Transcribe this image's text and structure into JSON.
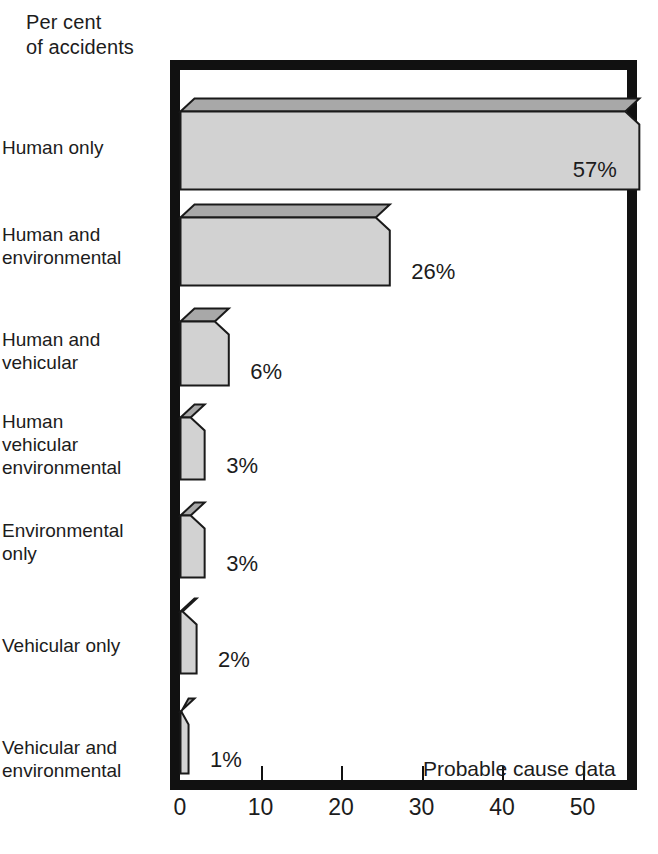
{
  "axis_caption": "Per cent\nof accidents",
  "annotation": "Probable cause data",
  "chart_data": {
    "type": "bar",
    "orientation": "horizontal",
    "title": "",
    "subtitle": "",
    "xlabel": "",
    "ylabel": "Per cent of accidents",
    "annotation": "Probable cause data",
    "xlim": [
      0,
      54
    ],
    "xticks": [
      0,
      10,
      20,
      30,
      40,
      50
    ],
    "xtick_labels": [
      "0",
      "10",
      "20",
      "30",
      "40",
      "50"
    ],
    "grid": false,
    "legend": false,
    "style": "3d-shaded-bars",
    "categories": [
      "Human only",
      "Human and\nenvironmental",
      "Human and\nvehicular",
      "Human\nvehicular\nenvironmental",
      "Environmental\nonly",
      "Vehicular only",
      "Vehicular and\nenvironmental"
    ],
    "values": [
      57,
      26,
      6,
      3,
      3,
      2,
      1
    ],
    "value_labels": [
      "57%",
      "26%",
      "6%",
      "3%",
      "3%",
      "2%",
      "1%"
    ]
  },
  "bars": [
    {
      "label": "Human only",
      "value": 57,
      "value_label": "57%",
      "label_position": "inside",
      "top": 28,
      "height": 78,
      "cat_label_top": 136
    },
    {
      "label": "Human and\nenvironmental",
      "value": 26,
      "value_label": "26%",
      "label_position": "outside",
      "top": 134,
      "height": 68,
      "cat_label_top": 223
    },
    {
      "label": "Human and\nvehicular",
      "value": 6,
      "value_label": "6%",
      "label_position": "outside",
      "top": 238,
      "height": 64,
      "cat_label_top": 328
    },
    {
      "label": "Human\nvehicular\nenvironmental",
      "value": 3,
      "value_label": "3%",
      "label_position": "outside",
      "top": 334,
      "height": 62,
      "cat_label_top": 410
    },
    {
      "label": "Environmental\nonly",
      "value": 3,
      "value_label": "3%",
      "label_position": "outside",
      "top": 432,
      "height": 62,
      "cat_label_top": 519
    },
    {
      "label": "Vehicular only",
      "value": 2,
      "value_label": "2%",
      "label_position": "outside",
      "top": 528,
      "height": 62,
      "cat_label_top": 634
    },
    {
      "label": "Vehicular and\nenvironmental",
      "value": 1,
      "value_label": "1%",
      "label_position": "outside",
      "top": 628,
      "height": 62,
      "cat_label_top": 736
    }
  ],
  "colors": {
    "frame": "#111111",
    "bar_front": "#d2d2d2",
    "bar_top": "#a8a8a8",
    "bar_outline": "#1a1a1a",
    "background": "#ffffff",
    "text": "#1c1c1c"
  },
  "geometry": {
    "px_per_unit": 8.05,
    "depth_x": 14,
    "depth_y": 13
  }
}
